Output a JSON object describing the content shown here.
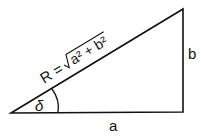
{
  "diagram": {
    "type": "right-triangle",
    "labels": {
      "hypotenuse_prefix": "R =",
      "radicand": "a² + b²",
      "vertical_side": "b",
      "horizontal_side": "a",
      "angle": "δ"
    },
    "colors": {
      "stroke": "#111111",
      "background": "#ffffff"
    }
  }
}
